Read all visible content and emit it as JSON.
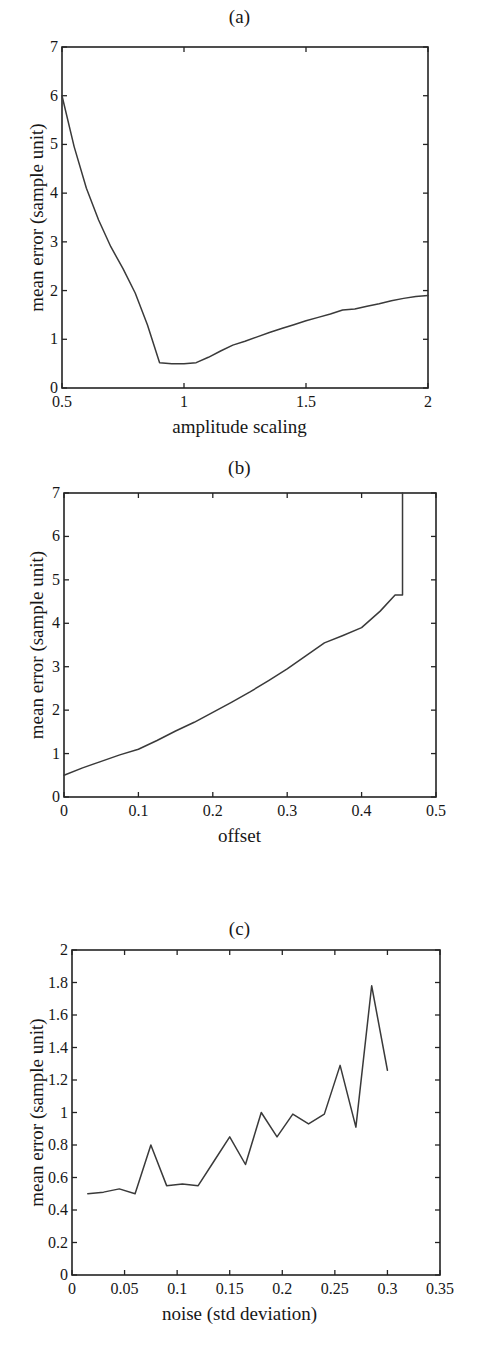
{
  "figure": {
    "panels": [
      "a",
      "b",
      "c"
    ],
    "shared_ylabel": "mean error (sample unit)"
  },
  "panel_a": {
    "title": "(a)",
    "xlabel": "amplitude scaling",
    "ylabel": "mean error (sample unit)",
    "xticks": [
      "0.5",
      "1",
      "1.5",
      "2"
    ],
    "yticks": [
      "0",
      "1",
      "2",
      "3",
      "4",
      "5",
      "6",
      "7"
    ]
  },
  "panel_b": {
    "title": "(b)",
    "xlabel": "offset",
    "ylabel": "mean error (sample unit)",
    "xticks": [
      "0",
      "0.1",
      "0.2",
      "0.3",
      "0.4",
      "0.5"
    ],
    "yticks": [
      "0",
      "1",
      "2",
      "3",
      "4",
      "5",
      "6",
      "7"
    ]
  },
  "panel_c": {
    "title": "(c)",
    "xlabel": "noise (std deviation)",
    "ylabel": "mean error (sample unit)",
    "xticks": [
      "0",
      "0.05",
      "0.1",
      "0.15",
      "0.2",
      "0.25",
      "0.3",
      "0.35"
    ],
    "yticks": [
      "0",
      "0.2",
      "0.4",
      "0.6",
      "0.8",
      "1",
      "1.2",
      "1.4",
      "1.6",
      "1.8",
      "2"
    ]
  },
  "chart_data": [
    {
      "type": "line",
      "title": "(a)",
      "xlabel": "amplitude scaling",
      "ylabel": "mean error (sample unit)",
      "xlim": [
        0.5,
        2.0
      ],
      "ylim": [
        0,
        7
      ],
      "xticks": [
        0.5,
        1.0,
        1.5,
        2.0
      ],
      "yticks": [
        0,
        1,
        2,
        3,
        4,
        5,
        6,
        7
      ],
      "grid": false,
      "legend": null,
      "line_color": "#3a3a3a",
      "x": [
        0.5,
        0.55,
        0.6,
        0.65,
        0.7,
        0.75,
        0.8,
        0.85,
        0.9,
        0.95,
        1.0,
        1.05,
        1.1,
        1.15,
        1.2,
        1.25,
        1.3,
        1.35,
        1.4,
        1.45,
        1.5,
        1.55,
        1.6,
        1.65,
        1.7,
        1.75,
        1.8,
        1.85,
        1.9,
        1.95,
        2.0
      ],
      "y": [
        6.0,
        4.95,
        4.1,
        3.45,
        2.9,
        2.45,
        1.95,
        1.3,
        0.52,
        0.5,
        0.5,
        0.52,
        0.63,
        0.76,
        0.88,
        0.96,
        1.05,
        1.14,
        1.22,
        1.3,
        1.38,
        1.45,
        1.52,
        1.6,
        1.62,
        1.68,
        1.73,
        1.79,
        1.84,
        1.88,
        1.9
      ]
    },
    {
      "type": "line",
      "title": "(b)",
      "xlabel": "offset",
      "ylabel": "mean error (sample unit)",
      "xlim": [
        0,
        0.5
      ],
      "ylim": [
        0,
        7
      ],
      "xticks": [
        0,
        0.1,
        0.2,
        0.3,
        0.4,
        0.5
      ],
      "yticks": [
        0,
        1,
        2,
        3,
        4,
        5,
        6,
        7
      ],
      "grid": false,
      "legend": null,
      "line_color": "#3a3a3a",
      "x": [
        0.0,
        0.025,
        0.05,
        0.075,
        0.1,
        0.125,
        0.15,
        0.175,
        0.2,
        0.225,
        0.25,
        0.275,
        0.3,
        0.325,
        0.35,
        0.375,
        0.4,
        0.425,
        0.445,
        0.455,
        0.455
      ],
      "y": [
        0.5,
        0.67,
        0.82,
        0.97,
        1.1,
        1.3,
        1.52,
        1.72,
        1.95,
        2.18,
        2.42,
        2.68,
        2.95,
        3.25,
        3.55,
        3.72,
        3.9,
        4.28,
        4.65,
        4.65,
        7.0
      ]
    },
    {
      "type": "line",
      "title": "(c)",
      "xlabel": "noise (std deviation)",
      "ylabel": "mean error (sample unit)",
      "xlim": [
        0,
        0.35
      ],
      "ylim": [
        0,
        2
      ],
      "xticks": [
        0,
        0.05,
        0.1,
        0.15,
        0.2,
        0.25,
        0.3,
        0.35
      ],
      "yticks": [
        0,
        0.2,
        0.4,
        0.6,
        0.8,
        1.0,
        1.2,
        1.4,
        1.6,
        1.8,
        2.0
      ],
      "grid": false,
      "legend": null,
      "line_color": "#3a3a3a",
      "x": [
        0.015,
        0.03,
        0.045,
        0.06,
        0.075,
        0.09,
        0.105,
        0.12,
        0.135,
        0.15,
        0.165,
        0.18,
        0.195,
        0.21,
        0.225,
        0.24,
        0.255,
        0.27,
        0.285,
        0.3
      ],
      "y": [
        0.5,
        0.51,
        0.53,
        0.5,
        0.8,
        0.55,
        0.56,
        0.55,
        0.7,
        0.85,
        0.68,
        1.0,
        0.85,
        0.99,
        0.93,
        0.99,
        1.29,
        0.91,
        1.78,
        1.26
      ]
    }
  ]
}
